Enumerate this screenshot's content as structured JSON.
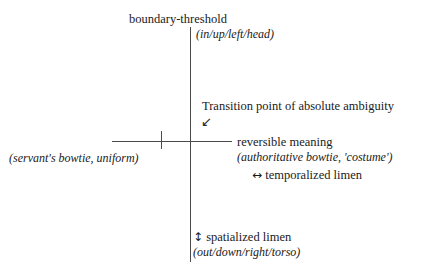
{
  "diagram": {
    "background_color": "#ffffff",
    "line_color": "#4a4a4a",
    "text_color": "#1a1a1a",
    "axis": {
      "vertical_label": "vertical-axis-line",
      "horizontal_label": "horizontal-axis-line",
      "tick_label": "horizontal-axis-tick"
    },
    "labels": {
      "title_upper": "boundary-threshold",
      "title_upper_paren": "(in/up/left/head)",
      "transition": "Transition point of absolute ambiguity",
      "transition_arrow": "↙",
      "left_paren": "(servant's bowtie, uniform)",
      "reversible": "reversible meaning",
      "authoritative_paren": "(authoritative bowtie, 'costume')",
      "temporalized_arrow": "↔",
      "temporalized": "temporalized limen",
      "spatialized_arrow": "↕",
      "spatialized": "spatialized limen",
      "spatialized_paren": "(out/down/right/torso)"
    }
  }
}
